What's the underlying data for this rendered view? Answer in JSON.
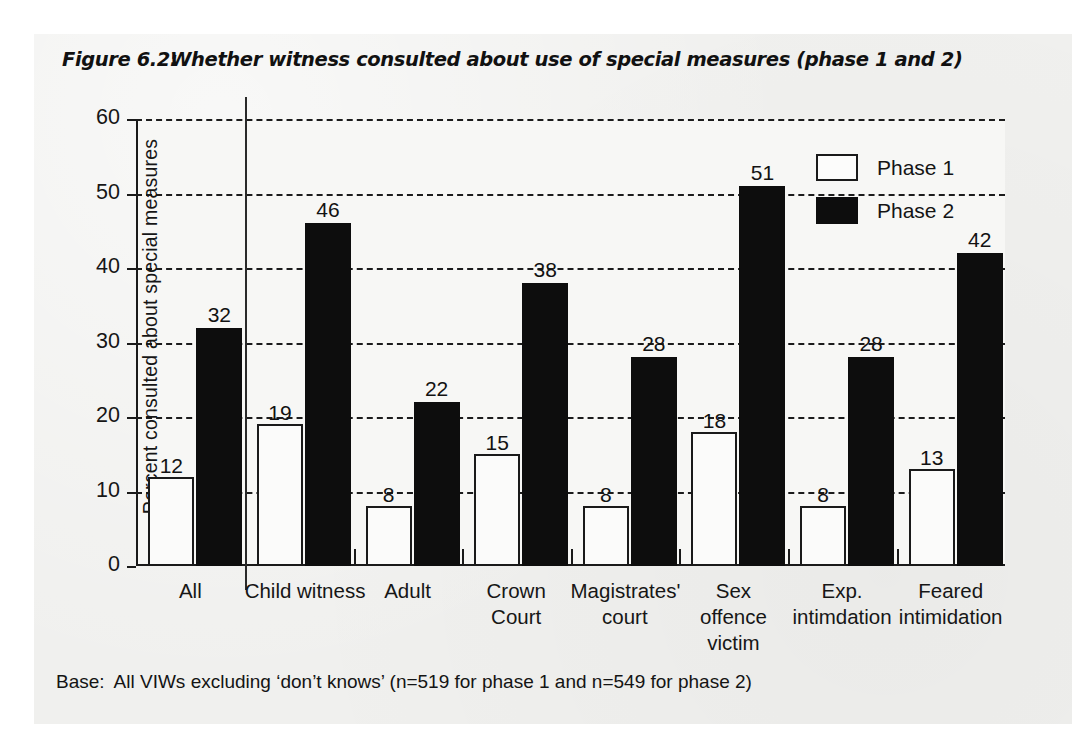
{
  "figure": {
    "number": "Figure 6.2:",
    "title": "Whether witness consulted about use of special measures (phase 1 and 2)"
  },
  "footnote": {
    "lead": "Base:",
    "text": "All VIWs excluding ‘don’t knows’ (n=519 for phase 1 and n=549 for phase 2)"
  },
  "colors": {
    "phase1_fill": "#fbfbfa",
    "phase2_fill": "#0d0d0d",
    "axis": "#1a1a1a",
    "page": "#f0f0ee",
    "plot_background": "#f7f7f5"
  },
  "chart_data": {
    "type": "bar",
    "title": "Whether witness consulted about use of special measures (phase 1 and 2)",
    "xlabel": "",
    "ylabel": "Percent consulted about special measures",
    "ylim": [
      0,
      60
    ],
    "yticks": [
      0,
      10,
      20,
      30,
      40,
      50,
      60
    ],
    "grid": true,
    "legend_position": "top-right",
    "categories": [
      "All",
      "Child witness",
      "Adult",
      "Crown Court",
      "Magistrates' court",
      "Sex offence victim",
      "Exp. intimdation",
      "Feared intimidation"
    ],
    "category_lines": [
      [
        "All"
      ],
      [
        "Child witness"
      ],
      [
        "Adult"
      ],
      [
        "Crown",
        "Court"
      ],
      [
        "Magistrates'",
        "court"
      ],
      [
        "Sex",
        "offence",
        "victim"
      ],
      [
        "Exp.",
        "intimdation"
      ],
      [
        "Feared",
        "intimidation"
      ]
    ],
    "series": [
      {
        "name": "Phase 1",
        "values": [
          12,
          19,
          8,
          15,
          8,
          18,
          8,
          13
        ]
      },
      {
        "name": "Phase 2",
        "values": [
          32,
          46,
          22,
          38,
          28,
          51,
          28,
          42
        ]
      }
    ],
    "annotations": [
      "Vertical separator line drawn between the 'All' group and the remaining subgroups"
    ]
  },
  "legend": {
    "items": [
      {
        "label": "Phase 1",
        "style": "outlined"
      },
      {
        "label": "Phase 2",
        "style": "filled"
      }
    ]
  }
}
